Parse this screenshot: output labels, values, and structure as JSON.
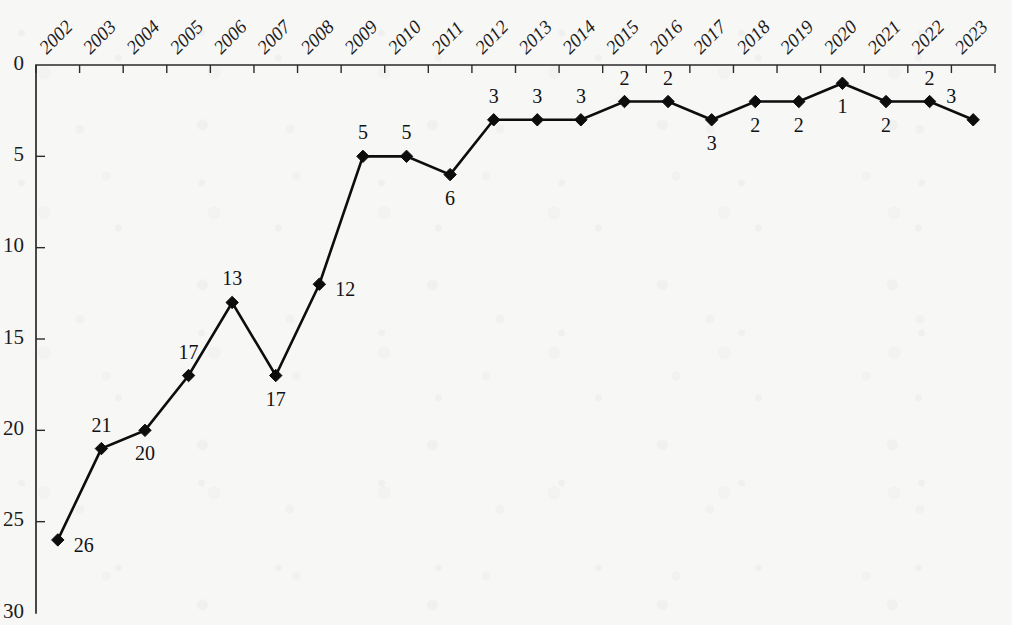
{
  "chart_data": {
    "type": "line",
    "title": "",
    "subtitle": "",
    "xlabel": "",
    "ylabel": "",
    "categories": [
      "2002",
      "2003",
      "2004",
      "2005",
      "2006",
      "2007",
      "2008",
      "2009",
      "2010",
      "2011",
      "2012",
      "2013",
      "2014",
      "2015",
      "2016",
      "2017",
      "2018",
      "2019",
      "2020",
      "2021",
      "2022",
      "2023"
    ],
    "values": [
      26,
      21,
      20,
      17,
      13,
      17,
      12,
      5,
      5,
      6,
      3,
      3,
      3,
      2,
      2,
      3,
      2,
      2,
      1,
      2,
      2,
      3
    ],
    "series": [
      {
        "name": "",
        "values": [
          26,
          21,
          20,
          17,
          13,
          17,
          12,
          5,
          5,
          6,
          3,
          3,
          3,
          2,
          2,
          3,
          2,
          2,
          1,
          2,
          2,
          3
        ]
      }
    ],
    "point_labels": [
      "26",
      "21",
      "20",
      "17",
      "13",
      "17",
      "12",
      "5",
      "5",
      "6",
      "3",
      "3",
      "3",
      "2",
      "2",
      "3",
      "2",
      "2",
      "1",
      "2",
      "2",
      "3"
    ],
    "point_label_positions": [
      "below-right",
      "above",
      "below",
      "above",
      "above",
      "below",
      "below-right",
      "above",
      "above",
      "below",
      "above",
      "above",
      "above",
      "above",
      "above",
      "below",
      "below",
      "below",
      "below",
      "below",
      "above",
      "above"
    ],
    "ylim": [
      0,
      30
    ],
    "y_inverted": true,
    "y_ticks": [
      "0",
      "5",
      "10",
      "15",
      "20",
      "25",
      "30"
    ],
    "y_tick_values": [
      0,
      5,
      10,
      15,
      20,
      25,
      30
    ],
    "x_tick_labels": [
      "2002",
      "2003",
      "2004",
      "2005",
      "2006",
      "2007",
      "2008",
      "2009",
      "2010",
      "2011",
      "2012",
      "2013",
      "2014",
      "2015",
      "2016",
      "2017",
      "2018",
      "2019",
      "2020",
      "2021",
      "2022",
      "2023"
    ],
    "x_tick_rotation_deg": -45,
    "grid": false,
    "legend": false,
    "legend_position": "none",
    "marker": "diamond",
    "line_color": "#0d0d0d",
    "marker_color": "#0d0d0d",
    "axis_color": "#2b2b2b",
    "background_color": "#f7f7f6",
    "annotations": []
  }
}
